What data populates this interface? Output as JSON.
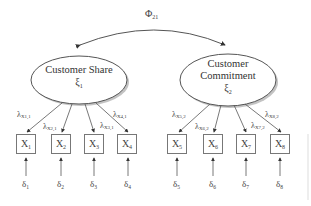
{
  "diagram": {
    "type": "confirmatory factor analysis path diagram",
    "covariance": {
      "symbol": "Φ",
      "subscript": "21"
    },
    "latents": [
      {
        "name_lines": [
          "Customer Share"
        ],
        "symbol": "ξ",
        "subscript": "1"
      },
      {
        "name_lines": [
          "Customer",
          "Commitment"
        ],
        "symbol": "ξ",
        "subscript": "2"
      }
    ],
    "indicators": [
      {
        "symbol": "X",
        "sub": "1",
        "loading": {
          "sym": "λ",
          "sub": "X1,1"
        },
        "error": {
          "sym": "δ",
          "sub": "1"
        }
      },
      {
        "symbol": "X",
        "sub": "2",
        "loading": {
          "sym": "λ",
          "sub": "X2,1"
        },
        "error": {
          "sym": "δ",
          "sub": "2"
        }
      },
      {
        "symbol": "X",
        "sub": "3",
        "loading": {
          "sym": "λ",
          "sub": "X3,1"
        },
        "error": {
          "sym": "δ",
          "sub": "3"
        }
      },
      {
        "symbol": "X",
        "sub": "4",
        "loading": {
          "sym": "λ",
          "sub": "X4,1"
        },
        "error": {
          "sym": "δ",
          "sub": "4"
        }
      },
      {
        "symbol": "X",
        "sub": "5",
        "loading": {
          "sym": "λ",
          "sub": "X5,2"
        },
        "error": {
          "sym": "δ",
          "sub": "5"
        }
      },
      {
        "symbol": "X",
        "sub": "6",
        "loading": {
          "sym": "λ",
          "sub": "X6,2"
        },
        "error": {
          "sym": "δ",
          "sub": "6"
        }
      },
      {
        "symbol": "X",
        "sub": "7",
        "loading": {
          "sym": "λ",
          "sub": "X7,2"
        },
        "error": {
          "sym": "δ",
          "sub": "7"
        }
      },
      {
        "symbol": "X",
        "sub": "8",
        "loading": {
          "sym": "λ",
          "sub": "X8,2"
        },
        "error": {
          "sym": "δ",
          "sub": "8"
        }
      }
    ]
  }
}
